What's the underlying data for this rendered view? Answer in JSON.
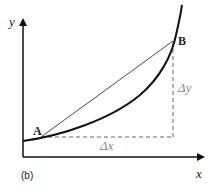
{
  "labels": {
    "y_axis": "y",
    "x_axis": "x",
    "point_a": "A",
    "point_b": "B",
    "delta_x": "Δx",
    "delta_y": "Δy",
    "caption": "(b)"
  },
  "colors": {
    "curve": "#111111",
    "axes": "#111111",
    "dashed": "#666666",
    "delta_text": "#888888"
  }
}
